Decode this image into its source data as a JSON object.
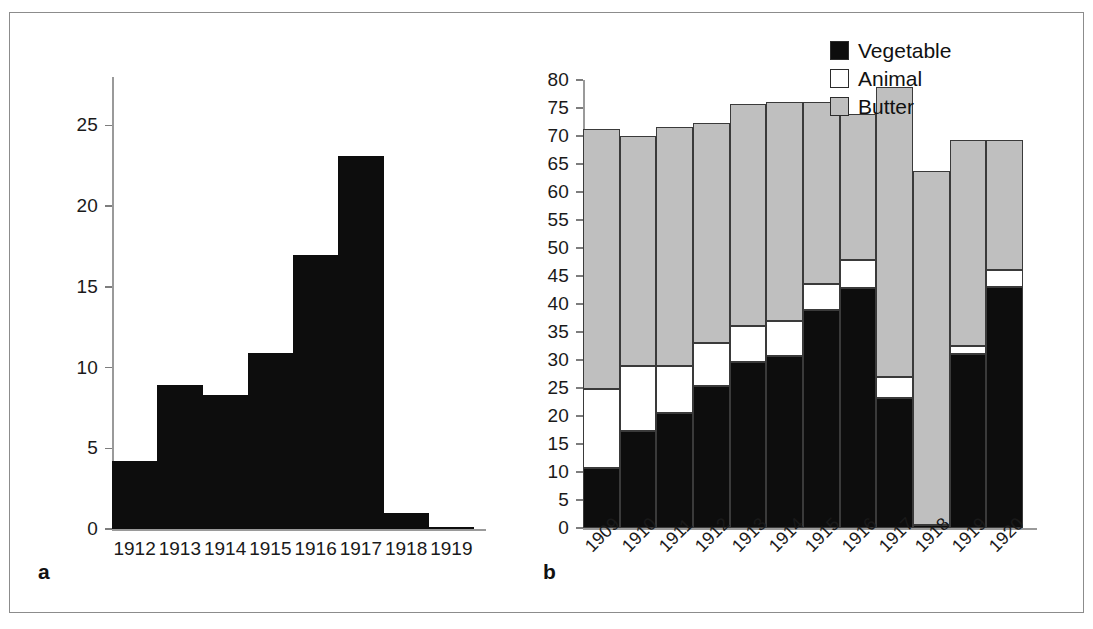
{
  "figure": {
    "background": "#ffffff",
    "border_color": "#8c8c8c"
  },
  "panel_a": {
    "label": "a",
    "bar_color": "#0d0d0d",
    "axis_color": "#9a9a9a"
  },
  "panel_b": {
    "label": "b",
    "axis_color": "#9a9a9a",
    "legend": {
      "position": "top-right",
      "items": [
        {
          "label": "Vegetable",
          "color": "#0d0d0d",
          "swatch": "filled-black-square-icon"
        },
        {
          "label": "Animal",
          "color": "#ffffff",
          "swatch": "empty-white-square-icon"
        },
        {
          "label": "Butter",
          "color": "#bfbfbf",
          "swatch": "filled-gray-square-icon"
        }
      ]
    }
  },
  "chart_data": [
    {
      "id": "panel-a",
      "type": "bar",
      "title": "",
      "xlabel": "",
      "ylabel": "",
      "categories": [
        "1912",
        "1913",
        "1914",
        "1915",
        "1916",
        "1917",
        "1918",
        "1919"
      ],
      "values": [
        4.2,
        8.9,
        8.3,
        10.9,
        17.0,
        23.1,
        1.0,
        0.15
      ],
      "ylim": [
        0,
        28
      ],
      "yticks": [
        0,
        5,
        10,
        15,
        20,
        25
      ],
      "ytick_labels": [
        "0",
        "5",
        "10",
        "15",
        "20",
        "25"
      ],
      "grid": false,
      "legend": "none",
      "series_color": "#0d0d0d"
    },
    {
      "id": "panel-b",
      "type": "bar",
      "stacked": true,
      "title": "",
      "xlabel": "",
      "ylabel": "",
      "categories": [
        "1909",
        "1910",
        "1911",
        "1912",
        "1913",
        "1914",
        "1915",
        "1916",
        "1917",
        "1918",
        "1919",
        "1920"
      ],
      "series": [
        {
          "name": "Vegetable",
          "color": "#0d0d0d",
          "values": [
            10.7,
            17.4,
            20.6,
            25.4,
            29.6,
            30.8,
            39.0,
            42.8,
            23.2,
            0.6,
            31.0,
            43.0
          ]
        },
        {
          "name": "Animal",
          "color": "#ffffff",
          "values": [
            14.1,
            11.6,
            8.4,
            7.6,
            6.4,
            6.2,
            4.6,
            5.0,
            3.7,
            0.0,
            1.5,
            3.0
          ]
        },
        {
          "name": "Butter",
          "color": "#bfbfbf",
          "values": [
            46.5,
            41.0,
            42.6,
            39.4,
            39.8,
            39.0,
            32.4,
            26.2,
            51.9,
            63.2,
            36.8,
            23.3
          ]
        }
      ],
      "totals": [
        71.3,
        70.0,
        71.6,
        72.4,
        75.8,
        76.0,
        76.0,
        74.0,
        78.8,
        63.8,
        69.3,
        69.3
      ],
      "ylim": [
        0,
        80
      ],
      "yticks": [
        0,
        5,
        10,
        15,
        20,
        25,
        30,
        35,
        40,
        45,
        50,
        55,
        60,
        65,
        70,
        75,
        80
      ],
      "ytick_labels": [
        "0",
        "5",
        "10",
        "15",
        "20",
        "25",
        "30",
        "35",
        "40",
        "45",
        "50",
        "55",
        "60",
        "65",
        "70",
        "75",
        "80"
      ],
      "grid": false,
      "legend": "top-right"
    }
  ]
}
